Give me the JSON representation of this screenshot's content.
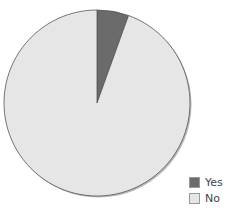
{
  "chart_data": {
    "type": "pie",
    "title": "",
    "categories": [
      "Yes",
      "No"
    ],
    "values": [
      5.5,
      94.5
    ],
    "colors": [
      "#6b6b6b",
      "#e6e6e6"
    ],
    "legend_position": "bottom-right",
    "start_angle_deg": 0,
    "direction": "clockwise"
  },
  "legend": {
    "items": [
      {
        "label": "Yes",
        "color": "#6b6b6b"
      },
      {
        "label": "No",
        "color": "#e6e6e6"
      }
    ]
  }
}
